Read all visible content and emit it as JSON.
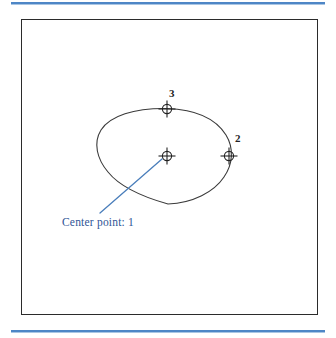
{
  "page": {
    "background_color": "#ffffff",
    "rule_color": "#4e86c6"
  },
  "figure": {
    "frame_border_color": "#2b2b2b",
    "shape": {
      "name": "ellipse",
      "stroke_color": "#3a3a3a",
      "center_x": 167,
      "center_y": 156,
      "radius_x": 68,
      "radius_y": 48
    }
  },
  "markers": [
    {
      "id": "center-point",
      "label": "1",
      "x": 167,
      "y": 156,
      "icon": "crosshair-circle-icon",
      "has_number_label": false
    },
    {
      "id": "point-2",
      "label": "2",
      "x": 229,
      "y": 156,
      "icon": "crosshair-circle-icon",
      "has_number_label": true,
      "label_x": 235,
      "label_y": 133
    },
    {
      "id": "point-3",
      "label": "3",
      "x": 167,
      "y": 109,
      "icon": "crosshair-circle-icon",
      "has_number_label": true,
      "label_x": 169,
      "label_y": 88
    }
  ],
  "annotation": {
    "text": "Center point: 1",
    "color": "#2f5596",
    "leader_line": {
      "color": "#4a7ebb",
      "from_x": 100,
      "from_y": 213,
      "to_x": 162,
      "to_y": 159
    }
  }
}
